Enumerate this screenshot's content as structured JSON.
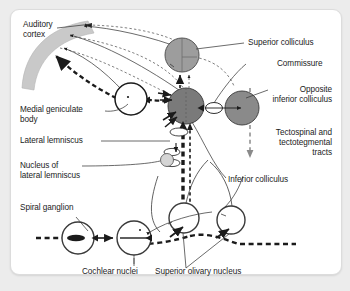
{
  "figure": {
    "background_color": "#ececec",
    "panel_color": "#ffffff",
    "structure_fill_dark": "#7a7a7a",
    "structure_fill_light": "#9d9d9d",
    "cortex_band_color": "#c9c9c9",
    "line_color": "#1b1b1b"
  },
  "labels": {
    "auditory_cortex": "Auditory\ncortex",
    "medial_geniculate_body": "Medial geniculate\nbody",
    "lateral_lemniscus": "Lateral lemniscus",
    "nucleus_of_lateral_lemniscus": "Nucleus of\nlateral lemniscus",
    "spiral_ganglion": "Spiral ganglion",
    "cochlear_nuclei": "Cochlear nuclei",
    "superior_olivary_nucleus": "Superior olivary nucleus",
    "superior_colliculus": "Superior colliculus",
    "commissure": "Commissure",
    "opposite_inferior_colliculus": "Opposite\ninferior colliculus",
    "tectospinal_tracts": "Tectospinal and\ntectotegmental\ntracts",
    "inferior_colliculus": "Inferior colliculus"
  },
  "structures": [
    {
      "name": "auditory-cortex",
      "shape": "curved-band",
      "fill": "#c9c9c9"
    },
    {
      "name": "medial-geniculate-body",
      "shape": "circle",
      "fill": "#ffffff"
    },
    {
      "name": "superior-colliculus",
      "shape": "circle",
      "fill": "#9d9d9d"
    },
    {
      "name": "inferior-colliculus",
      "shape": "circle",
      "fill": "#7a7a7a"
    },
    {
      "name": "opposite-inferior-colliculus",
      "shape": "circle",
      "fill": "#8a8a8a"
    },
    {
      "name": "commissure",
      "shape": "lens",
      "fill": "#ffffff"
    },
    {
      "name": "nucleus-of-lateral-lemniscus",
      "shape": "circle",
      "fill": "#d0d0d0"
    },
    {
      "name": "spiral-ganglion",
      "shape": "circle",
      "fill": "#ffffff"
    },
    {
      "name": "cochlear-nuclei",
      "shape": "circle",
      "fill": "#ffffff"
    },
    {
      "name": "superior-olivary-nucleus-left",
      "shape": "circle",
      "fill": "#ffffff"
    },
    {
      "name": "superior-olivary-nucleus-right",
      "shape": "circle",
      "fill": "#ffffff"
    }
  ],
  "pathways": [
    {
      "name": "ascending-lateral-lemniscus",
      "style": "thick-dashed",
      "direction": "upward"
    },
    {
      "name": "descending-corticofugal",
      "style": "thin-dashed",
      "direction": "downward"
    },
    {
      "name": "thalamocortical",
      "style": "solid",
      "direction": "upward"
    },
    {
      "name": "tectospinal-and-tectotegmental",
      "style": "dashed",
      "direction": "downward"
    }
  ]
}
